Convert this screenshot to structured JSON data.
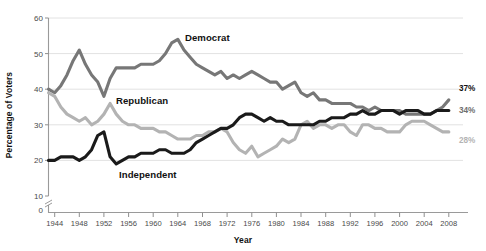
{
  "chart_data": {
    "type": "line",
    "title": "",
    "xlabel": "Year",
    "ylabel": "Percentage of Voters",
    "xlim": [
      1943,
      2009
    ],
    "ylim": [
      10,
      60
    ],
    "y_axis_break": true,
    "y_axis_break_note": "axis broken between 0 and 10",
    "grid": "horizontal",
    "legend": "inline-labels",
    "xticks": [
      1944,
      1948,
      1952,
      1956,
      1960,
      1964,
      1968,
      1972,
      1976,
      1980,
      1984,
      1988,
      1992,
      1996,
      2000,
      2004,
      2008
    ],
    "yticks": [
      0,
      10,
      20,
      30,
      40,
      50,
      60
    ],
    "x": [
      1943,
      1944,
      1945,
      1946,
      1947,
      1948,
      1949,
      1950,
      1951,
      1952,
      1953,
      1954,
      1955,
      1956,
      1957,
      1958,
      1959,
      1960,
      1961,
      1962,
      1963,
      1964,
      1965,
      1966,
      1967,
      1968,
      1969,
      1970,
      1971,
      1972,
      1973,
      1974,
      1975,
      1976,
      1977,
      1978,
      1979,
      1980,
      1981,
      1982,
      1983,
      1984,
      1985,
      1986,
      1987,
      1988,
      1989,
      1990,
      1991,
      1992,
      1993,
      1994,
      1995,
      1996,
      1997,
      1998,
      1999,
      2000,
      2001,
      2002,
      2003,
      2004,
      2005,
      2006,
      2007,
      2008
    ],
    "series": [
      {
        "name": "Democrat",
        "color": "#777777",
        "end_label": "37%",
        "values": [
          40,
          39,
          41,
          44,
          48,
          51,
          47,
          44,
          42,
          38,
          43,
          46,
          46,
          46,
          46,
          47,
          47,
          47,
          48,
          50,
          53,
          54,
          51,
          49,
          47,
          46,
          45,
          44,
          45,
          43,
          44,
          43,
          44,
          45,
          44,
          43,
          42,
          42,
          40,
          41,
          42,
          39,
          38,
          39,
          37,
          37,
          36,
          36,
          36,
          36,
          35,
          35,
          34,
          35,
          34,
          34,
          34,
          34,
          33,
          33,
          33,
          33,
          33,
          34,
          35,
          37
        ]
      },
      {
        "name": "Republican",
        "color": "#b3b3b3",
        "end_label": "28%",
        "values": [
          39,
          38,
          35,
          33,
          32,
          31,
          32,
          30,
          31,
          33,
          36,
          33,
          31,
          30,
          30,
          29,
          29,
          29,
          28,
          28,
          27,
          26,
          26,
          26,
          27,
          27,
          28,
          28,
          29,
          28,
          25,
          23,
          22,
          24,
          21,
          22,
          23,
          24,
          26,
          25,
          26,
          30,
          31,
          29,
          30,
          30,
          29,
          30,
          30,
          28,
          27,
          30,
          30,
          29,
          29,
          28,
          28,
          28,
          30,
          31,
          31,
          31,
          30,
          29,
          28,
          28
        ]
      },
      {
        "name": "Independent",
        "color": "#1a1a1a",
        "end_label": "34%",
        "values": [
          20,
          20,
          21,
          21,
          21,
          20,
          21,
          23,
          27,
          28,
          21,
          19,
          20,
          21,
          21,
          22,
          22,
          22,
          23,
          23,
          22,
          22,
          22,
          23,
          25,
          26,
          27,
          28,
          29,
          29,
          30,
          32,
          33,
          33,
          32,
          31,
          32,
          31,
          31,
          30,
          30,
          30,
          30,
          30,
          31,
          31,
          32,
          32,
          32,
          33,
          33,
          34,
          33,
          33,
          34,
          34,
          34,
          33,
          34,
          34,
          34,
          33,
          33,
          34,
          34,
          34
        ]
      }
    ],
    "annotations": [
      {
        "name": "democrat-label",
        "text": "Democrat"
      },
      {
        "name": "republican-label",
        "text": "Republican"
      },
      {
        "name": "independent-label",
        "text": "Independent"
      }
    ]
  },
  "axes": {
    "y_title": "Percentage of Voters",
    "x_title": "Year"
  },
  "labels": {
    "democrat": "Democrat",
    "republican": "Republican",
    "independent": "Independent",
    "end_dem": "37%",
    "end_ind": "34%",
    "end_rep": "28%"
  },
  "yticks_text": [
    "60",
    "50",
    "40",
    "30",
    "20",
    "10",
    "0"
  ],
  "xticks_text": [
    "1944",
    "1948",
    "1952",
    "1956",
    "1960",
    "1964",
    "1968",
    "1972",
    "1976",
    "1980",
    "1984",
    "1988",
    "1992",
    "1996",
    "2000",
    "2004",
    "2008"
  ]
}
